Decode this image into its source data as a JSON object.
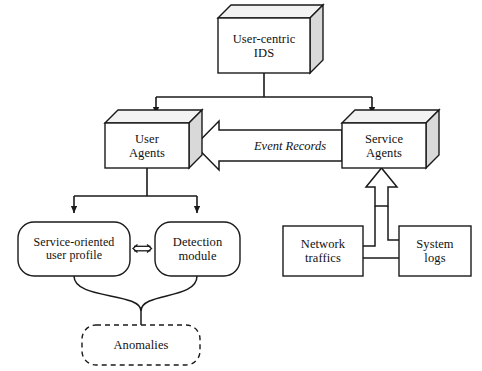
{
  "figure": {
    "top_caption_faint": "",
    "stroke_color": "#1a1a1a",
    "fill_color": "#ffffff",
    "shade_color": "#d9d9d9",
    "background": "#ffffff"
  },
  "nodes": {
    "ids": {
      "label": "User-centric\nIDS",
      "shape": "cube",
      "x": 218,
      "y": 18,
      "w": 92,
      "h": 55,
      "depth": 13
    },
    "user_agents": {
      "label": "User\nAgents",
      "shape": "cube",
      "x": 105,
      "y": 123,
      "w": 84,
      "h": 45,
      "depth": 13
    },
    "service_agents": {
      "label": "Service\nAgents",
      "shape": "cube",
      "x": 342,
      "y": 123,
      "w": 84,
      "h": 45,
      "depth": 13
    },
    "user_profile": {
      "label": "Service-oriented\nuser profile",
      "shape": "rounded-rect",
      "x": 18,
      "y": 222,
      "w": 112,
      "h": 54
    },
    "detection": {
      "label": "Detection\nmodule",
      "shape": "rounded-rect",
      "x": 155,
      "y": 222,
      "w": 85,
      "h": 54
    },
    "anomalies": {
      "label": "Anomalies",
      "shape": "rounded-rect-dashed",
      "x": 82,
      "y": 325,
      "w": 118,
      "h": 40
    },
    "network_traffics": {
      "label": "Network\ntraffics",
      "shape": "rect",
      "x": 283,
      "y": 226,
      "w": 80,
      "h": 50
    },
    "system_logs": {
      "label": "System\nlogs",
      "shape": "rect",
      "x": 399,
      "y": 226,
      "w": 72,
      "h": 50
    }
  },
  "edges": {
    "ids_to_user_agents": {
      "type": "line-arrow",
      "label": ""
    },
    "ids_to_service_agents": {
      "type": "line-arrow",
      "label": ""
    },
    "service_to_user_agents": {
      "type": "block-arrow",
      "label": "Event Records"
    },
    "user_agents_to_profile": {
      "type": "line-arrow",
      "label": ""
    },
    "user_agents_to_detection": {
      "type": "line-arrow",
      "label": ""
    },
    "profile_detection_bidirectional": {
      "type": "double-arrow",
      "label": ""
    },
    "profile_detection_to_anomalies": {
      "type": "brace-line",
      "label": ""
    },
    "sources_to_service_agents": {
      "type": "block-arrow-up",
      "label": ""
    },
    "network_to_system_logs": {
      "type": "line",
      "label": ""
    }
  }
}
